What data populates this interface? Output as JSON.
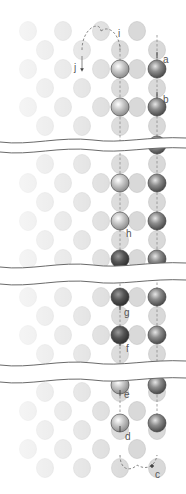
{
  "diagram": {
    "type": "atomic-lattice-migration-path",
    "colors": {
      "background": "#ffffff",
      "lattice_atom_fill": "#d9d9d9",
      "lattice_atom_stroke": "#c2c2c2",
      "highlight_light": "#b8b8b8",
      "highlight_medium": "#7c7c7c",
      "highlight_dark": "#4e4e4e",
      "path_line": "#7a7a7a",
      "break_line": "#6a6a6a",
      "label": "#555555"
    },
    "grid": {
      "columns_odd": [
        28,
        63,
        101,
        137
      ],
      "columns_even": [
        45,
        82,
        120,
        157
      ],
      "row_spacing": 19
    },
    "breaks": [
      {
        "upper_y": 140,
        "lower_y": 150
      },
      {
        "upper_y": 265,
        "lower_y": 282
      },
      {
        "upper_y": 363,
        "lower_y": 380
      }
    ],
    "labels": {
      "a": "a",
      "b": "b",
      "c": "c",
      "d": "d",
      "e": "e",
      "f": "f",
      "g": "g",
      "h": "h",
      "i": "i",
      "j": "j"
    }
  }
}
